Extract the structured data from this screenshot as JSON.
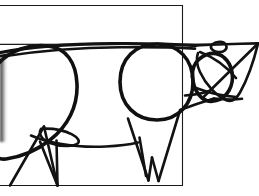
{
  "artwork": {
    "title": "Cow line drawing",
    "subject": "cow",
    "style": "geometric contour line art",
    "background_color": "#ffffff",
    "ink_color": "#121212",
    "frame_line_color": "#1a1a1a",
    "canvas": {
      "width": 259,
      "height": 196
    },
    "elements": {
      "frame_label": "partial rectangle frame",
      "horizon_label": "horizontal guide line",
      "back_label": "back contour line",
      "haunch_label": "rear haunch oval",
      "shoulder_label": "shoulder circle",
      "belly_label": "belly line",
      "udder_label": "udder crescent",
      "rear_leg_label": "rear leg triangle",
      "front_leg_label": "front leg wedge",
      "head_label": "head oval",
      "ear_label": "ear loop",
      "snout_label": "snout triangle",
      "horn_label": "horn line",
      "jaw_label": "jaw curve",
      "neck_label": "neck line",
      "edge_artifact_label": "scan edge shadow"
    }
  }
}
